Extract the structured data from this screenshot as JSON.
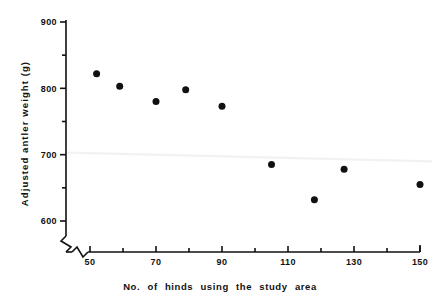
{
  "chart_data": {
    "type": "scatter",
    "title": "",
    "xlabel": "No. of hinds using the study area",
    "ylabel": "Adjusted antler weight (g)",
    "xlim": [
      46,
      152
    ],
    "ylim": [
      575,
      900
    ],
    "x_major_ticks": [
      50,
      70,
      90,
      110,
      130,
      150
    ],
    "x_minor_ticks": [
      60,
      80,
      100,
      120,
      140
    ],
    "y_major_ticks": [
      600,
      700,
      800,
      900
    ],
    "y_minor_ticks": [
      650,
      750,
      850
    ],
    "x_tick_labels": [
      "50",
      "70",
      "90",
      "110",
      "130",
      "150"
    ],
    "y_tick_labels": [
      "600",
      "700",
      "800",
      "900"
    ],
    "grid": false,
    "legend": "none",
    "axis_break_x": true,
    "axis_break_y": true,
    "marker": "filled-circle",
    "marker_color": "#111111",
    "marker_size": 4.6,
    "points": [
      {
        "x": 52,
        "y": 822
      },
      {
        "x": 59,
        "y": 803
      },
      {
        "x": 70,
        "y": 780
      },
      {
        "x": 79,
        "y": 798
      },
      {
        "x": 90,
        "y": 773
      },
      {
        "x": 105,
        "y": 685
      },
      {
        "x": 118,
        "y": 632
      },
      {
        "x": 127,
        "y": 678
      },
      {
        "x": 150,
        "y": 655
      }
    ],
    "trend_line": {
      "visible": true,
      "color": "#f2f2f2",
      "x_start": 46,
      "y_start": 703,
      "x_end": 152,
      "y_end": 690
    }
  },
  "colors": {
    "axis": "#111111",
    "marker": "#111111",
    "background": "#ffffff",
    "trend": "#f2f2f2"
  }
}
